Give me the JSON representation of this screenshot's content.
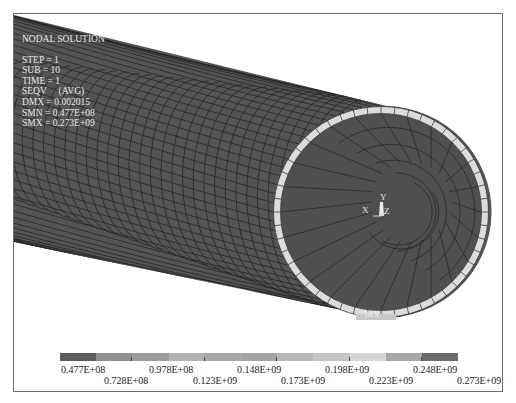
{
  "plot": {
    "title": "NODAL SOLUTION",
    "step": "STEP = 1",
    "sub": "SUB = 10",
    "time": "TIME = 1",
    "result": "SEQV     (AVG)",
    "dmx": "DMX = 0.002015",
    "smn": "SMN = 0.477E+08",
    "smx": "SMX = 0.273E+09",
    "max_marker": "MX"
  },
  "triad": {
    "x": "X",
    "y": "Y",
    "z": "Z"
  },
  "legend": {
    "colors": [
      "#5c5c5c",
      "#8f8f8f",
      "#9d9d9d",
      "#b3b3b3",
      "#a9a9a9",
      "#a4a4a4",
      "#b7b7b7",
      "#c4c4c4",
      "#d6d6d6",
      "#a8a8a8",
      "#6c6c6c"
    ],
    "labels_top": [
      "0.477E+08",
      "0.978E+08",
      "0.148E+09",
      "0.198E+09",
      "0.248E+09"
    ],
    "labels_bottom": [
      "0.728E+08",
      "0.123E+09",
      "0.173E+09",
      "0.223E+09",
      "0.273E+09"
    ]
  },
  "colors": {
    "pipe_surface": "#545454",
    "mesh_line": "#262626",
    "ring_face": "#dcdcdc",
    "frame": "#6e6e6e"
  }
}
